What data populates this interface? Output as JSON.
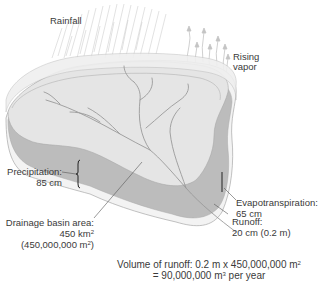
{
  "labels": {
    "rainfall": "Rainfall",
    "rising_vapor": [
      "Rising",
      "vapor"
    ],
    "precipitation": [
      "Precipitation:",
      "85 cm"
    ],
    "evapotranspiration": [
      "Evapotranspiration:",
      "65 cm"
    ],
    "runoff": [
      "Runoff:",
      "20 cm (0.2 m)"
    ],
    "drainage_basin": [
      "Drainage basin area:",
      "450 km",
      "2",
      "(450,000,000 m",
      "2",
      ")"
    ],
    "volume": [
      "Volume of runoff: 0.2 m x 450,000,000 m",
      "2",
      "= 90,000,000 m",
      "3",
      " per year"
    ]
  },
  "colors": {
    "top_surface": "#e6e6e6",
    "rim": "#eeeeee",
    "water_band": "#b9b9b9",
    "base": "#f2f2f2",
    "outline": "#a8a8a8",
    "streams": "#9a9a9a",
    "text": "#3a3a3a",
    "rain": "#c8c8c8"
  }
}
